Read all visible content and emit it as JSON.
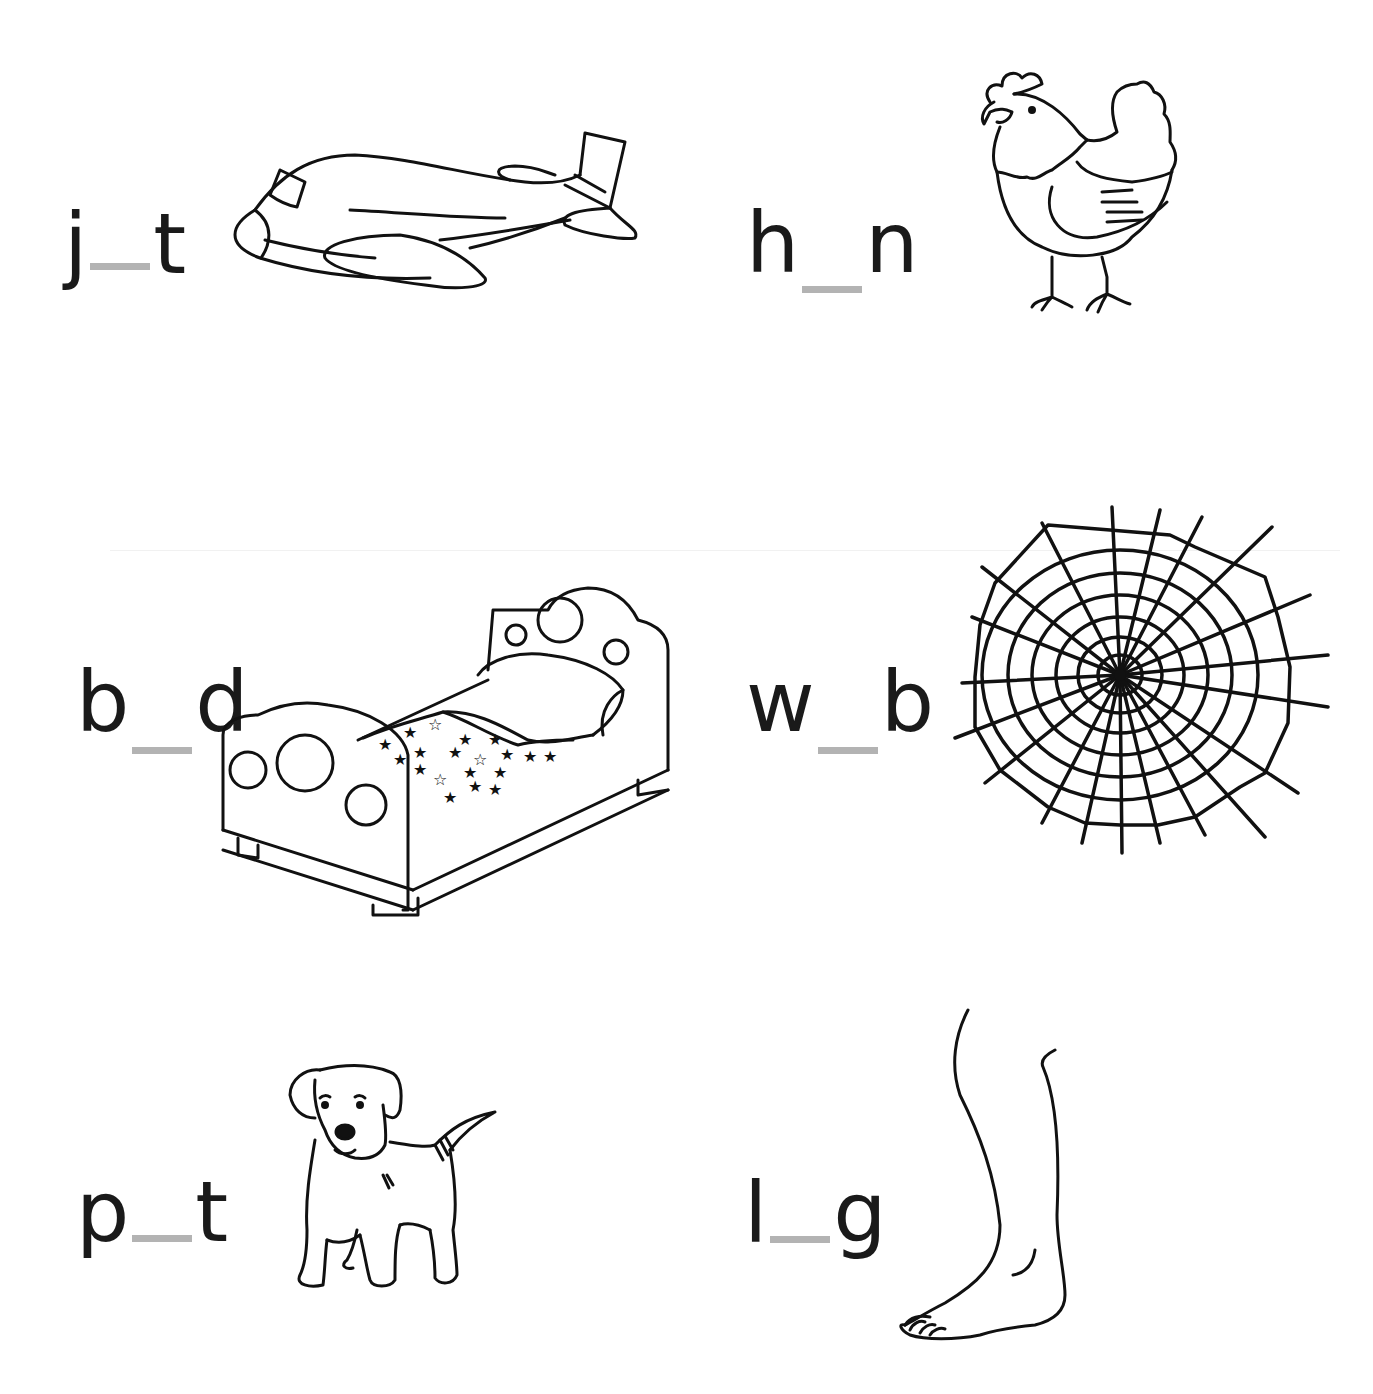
{
  "worksheet": {
    "blank_color": "#b3b3b3",
    "ink_color": "#1a1a1a",
    "items": [
      {
        "first": "j",
        "last": "t",
        "picture": "airplane-jet",
        "answer_hidden": "e"
      },
      {
        "first": "h",
        "last": "n",
        "picture": "hen",
        "answer_hidden": "e"
      },
      {
        "first": "b",
        "last": "d",
        "picture": "bed",
        "answer_hidden": "e"
      },
      {
        "first": "w",
        "last": "b",
        "picture": "spider-web",
        "answer_hidden": "e"
      },
      {
        "first": "p",
        "last": "t",
        "picture": "puppy-pet",
        "answer_hidden": "e"
      },
      {
        "first": "l",
        "last": "g",
        "picture": "leg",
        "answer_hidden": "e"
      }
    ]
  }
}
